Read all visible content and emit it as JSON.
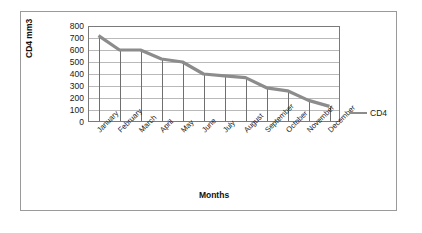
{
  "chart_data": {
    "type": "line",
    "title": "",
    "xlabel": "Months",
    "ylabel": "CD4 mm3",
    "categories": [
      "January",
      "February",
      "March",
      "April",
      "May",
      "June",
      "July",
      "August",
      "September",
      "October",
      "November",
      "December"
    ],
    "series": [
      {
        "name": "CD4",
        "values": [
          720,
          600,
          600,
          525,
          500,
          400,
          385,
          370,
          285,
          260,
          180,
          130
        ],
        "color": "#8c8c8c"
      }
    ],
    "yticks": [
      0,
      100,
      200,
      300,
      400,
      500,
      600,
      700,
      800
    ],
    "ylim": [
      0,
      800
    ],
    "grid": "horizontal",
    "legend_position": "right",
    "legend_entries": [
      "CD4"
    ],
    "drop_lines": true
  },
  "legend": {
    "label": "CD4"
  },
  "axes": {
    "y_title": "CD4 mm3",
    "x_title": "Months"
  }
}
